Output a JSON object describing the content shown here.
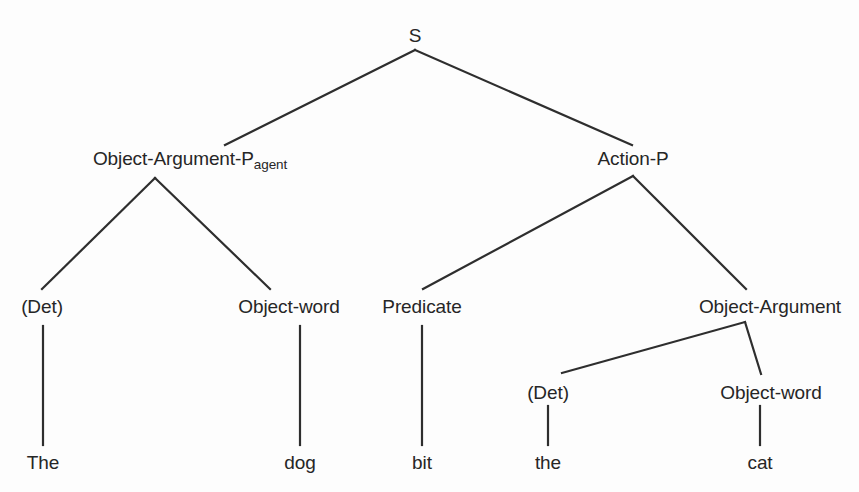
{
  "diagram": {
    "type": "constituency-syntax-tree",
    "sentence": "The dog bit the cat",
    "background_color": "#fdfdfd",
    "line_color": "#2e2e2e",
    "text_color": "#262626",
    "nodes": {
      "root": {
        "label": "S",
        "x": 415,
        "y": 35
      },
      "subject_phrase": {
        "label_main": "Object-Argument-P",
        "label_subscript": "agent",
        "x": 190,
        "y": 158
      },
      "predicate_phrase": {
        "label": "Action-P",
        "x": 633,
        "y": 158
      },
      "subject_det": {
        "label": "(Det)",
        "x": 42,
        "y": 306
      },
      "subject_noun": {
        "label": "Object-word",
        "x": 289,
        "y": 306
      },
      "verb": {
        "label": "Predicate",
        "x": 422,
        "y": 306
      },
      "object_phrase": {
        "label": "Object-Argument",
        "x": 770,
        "y": 306
      },
      "object_det": {
        "label": "(Det)",
        "x": 548,
        "y": 392
      },
      "object_noun": {
        "label": "Object-word",
        "x": 771,
        "y": 392
      }
    },
    "terminals": [
      {
        "label": "The",
        "x": 43,
        "y": 462
      },
      {
        "label": "dog",
        "x": 300,
        "y": 462
      },
      {
        "label": "bit",
        "x": 422,
        "y": 462
      },
      {
        "label": "the",
        "x": 548,
        "y": 462
      },
      {
        "label": "cat",
        "x": 760,
        "y": 462
      }
    ],
    "edges": [
      {
        "name": "s-to-subject",
        "x1": 415,
        "y1": 50,
        "x2": 225,
        "y2": 145
      },
      {
        "name": "s-to-predicate",
        "x1": 415,
        "y1": 50,
        "x2": 632,
        "y2": 145
      },
      {
        "name": "subject-to-det",
        "x1": 155,
        "y1": 178,
        "x2": 42,
        "y2": 289
      },
      {
        "name": "subject-to-noun",
        "x1": 155,
        "y1": 178,
        "x2": 270,
        "y2": 289
      },
      {
        "name": "predicate-to-verb",
        "x1": 633,
        "y1": 176,
        "x2": 423,
        "y2": 289
      },
      {
        "name": "predicate-to-object",
        "x1": 633,
        "y1": 176,
        "x2": 746,
        "y2": 289
      },
      {
        "name": "object-to-det",
        "x1": 745,
        "y1": 322,
        "x2": 562,
        "y2": 373
      },
      {
        "name": "object-to-noun",
        "x1": 745,
        "y1": 322,
        "x2": 761,
        "y2": 374
      },
      {
        "name": "det-to-the-upper",
        "x1": 43,
        "y1": 326,
        "x2": 43,
        "y2": 445
      },
      {
        "name": "noun-to-dog",
        "x1": 300,
        "y1": 326,
        "x2": 300,
        "y2": 445
      },
      {
        "name": "verb-to-bit",
        "x1": 422,
        "y1": 326,
        "x2": 422,
        "y2": 445
      },
      {
        "name": "det-to-the-lower",
        "x1": 548,
        "y1": 406,
        "x2": 548,
        "y2": 445
      },
      {
        "name": "noun-to-cat",
        "x1": 760,
        "y1": 406,
        "x2": 760,
        "y2": 445
      }
    ]
  }
}
